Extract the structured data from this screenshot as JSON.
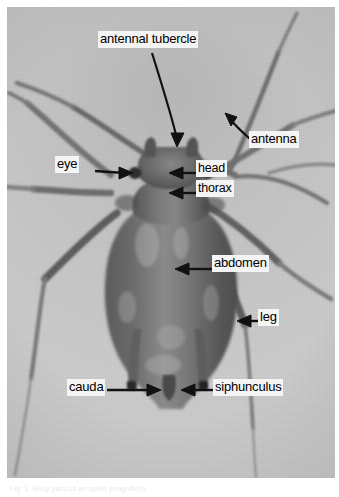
{
  "figure": {
    "type": "annotated-photograph",
    "subject": "aphid",
    "caption": "Fig. 1.  Body parts of an aphid (magnified)."
  },
  "labels": [
    {
      "id": "antennal-tubercle",
      "text": "antennal tubercle",
      "x": 98,
      "y": 31
    },
    {
      "id": "antenna",
      "text": "antenna",
      "x": 249,
      "y": 131
    },
    {
      "id": "eye",
      "text": "eye",
      "x": 55,
      "y": 156
    },
    {
      "id": "head",
      "text": "head",
      "x": 196,
      "y": 160
    },
    {
      "id": "thorax",
      "text": "thorax",
      "x": 196,
      "y": 180
    },
    {
      "id": "abdomen",
      "text": "abdomen",
      "x": 212,
      "y": 255
    },
    {
      "id": "leg",
      "text": "leg",
      "x": 258,
      "y": 309
    },
    {
      "id": "cauda",
      "text": "cauda",
      "x": 67,
      "y": 379
    },
    {
      "id": "siphunculus",
      "text": "siphunculus",
      "x": 213,
      "y": 379
    }
  ],
  "colors": {
    "label_background": "#f4f4f4",
    "label_text": "#000000",
    "arrow": "#111111",
    "photo_light": "#f2f2f2",
    "photo_dark": "#4a4a4a",
    "page_background": "#ffffff"
  }
}
